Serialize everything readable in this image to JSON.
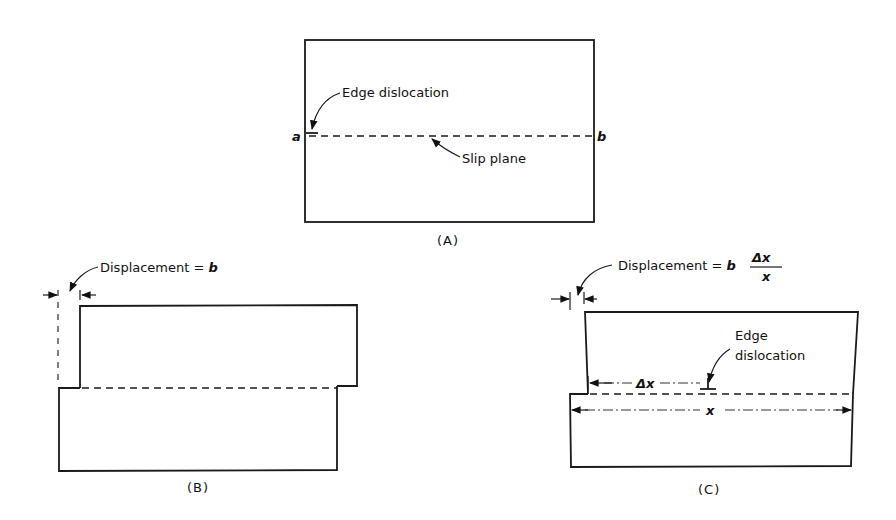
{
  "figure": {
    "panels": [
      {
        "id": "A",
        "caption": "(A)",
        "labels": {
          "edge_dislocation": "Edge dislocation",
          "slip_plane": "Slip plane",
          "point_a": "a",
          "point_b": "b"
        }
      },
      {
        "id": "B",
        "caption": "(B)",
        "labels": {
          "displacement": "Displacement = ",
          "displacement_symbol": "b"
        }
      },
      {
        "id": "C",
        "caption": "(C)",
        "labels": {
          "displacement": "Displacement = ",
          "displacement_symbol": "b",
          "fraction_numerator": "Δx",
          "fraction_denominator": "x",
          "edge_dislocation_line1": "Edge",
          "edge_dislocation_line2": "dislocation",
          "delta_x": "Δx",
          "x": "x"
        }
      }
    ]
  }
}
